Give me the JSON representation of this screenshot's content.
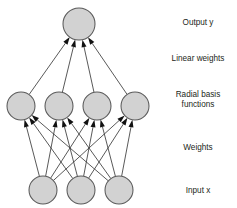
{
  "diagram": {
    "type": "neural-network-architecture",
    "background_color": "#ffffff",
    "node_fill_color": "#d2d2d2",
    "node_stroke_color": "#5a5a5a",
    "edge_color": "#3b3b3b",
    "arrow_color": "#111111",
    "text_color": "#231f20",
    "labels": [
      {
        "id": "output",
        "text": "Output y",
        "x": 198,
        "y": 25,
        "lines": [
          "Output y"
        ]
      },
      {
        "id": "linear-weights",
        "text": "Linear weights",
        "x": 198,
        "y": 61,
        "lines": [
          "Linear weights"
        ]
      },
      {
        "id": "radial-basis-functions",
        "text": "Radial basis functions",
        "x": 198,
        "y": 102,
        "lines": [
          "Radial basis",
          "functions"
        ]
      },
      {
        "id": "weights",
        "text": "Weights",
        "x": 198,
        "y": 150,
        "lines": [
          "Weights"
        ]
      },
      {
        "id": "input",
        "text": "Input x",
        "x": 198,
        "y": 193,
        "lines": [
          "Input x"
        ]
      }
    ],
    "layers": [
      {
        "id": "output-layer",
        "name": "output-layer",
        "role": "Output y",
        "node_count": 1,
        "radius": 16,
        "cy": 24,
        "nodes": [
          {
            "id": "output-node-1",
            "cx": 79,
            "cy": 24
          }
        ]
      },
      {
        "id": "hidden-layer",
        "name": "radial-basis-layer",
        "role": "Radial basis functions",
        "node_count": 4,
        "radius": 14,
        "cy": 106,
        "nodes": [
          {
            "id": "hidden-node-1",
            "cx": 21,
            "cy": 106
          },
          {
            "id": "hidden-node-2",
            "cx": 59,
            "cy": 106
          },
          {
            "id": "hidden-node-3",
            "cx": 97,
            "cy": 106
          },
          {
            "id": "hidden-node-4",
            "cx": 135,
            "cy": 106
          }
        ]
      },
      {
        "id": "input-layer",
        "name": "input-layer",
        "role": "Input x",
        "node_count": 3,
        "radius": 14,
        "cy": 190,
        "nodes": [
          {
            "id": "input-node-1",
            "cx": 43,
            "cy": 190
          },
          {
            "id": "input-node-2",
            "cx": 81,
            "cy": 190
          },
          {
            "id": "input-node-3",
            "cx": 119,
            "cy": 190
          }
        ]
      }
    ],
    "connections": {
      "hidden_to_output": {
        "label": "Linear weights",
        "count": 4,
        "directed": true,
        "edges": [
          {
            "from": "hidden-node-1",
            "to": "output-node-1"
          },
          {
            "from": "hidden-node-2",
            "to": "output-node-1"
          },
          {
            "from": "hidden-node-3",
            "to": "output-node-1"
          },
          {
            "from": "hidden-node-4",
            "to": "output-node-1"
          }
        ]
      },
      "input_to_hidden": {
        "label": "Weights",
        "count": 12,
        "directed": true,
        "edges": [
          {
            "from": "input-node-1",
            "to": "hidden-node-1"
          },
          {
            "from": "input-node-1",
            "to": "hidden-node-2"
          },
          {
            "from": "input-node-1",
            "to": "hidden-node-3"
          },
          {
            "from": "input-node-1",
            "to": "hidden-node-4"
          },
          {
            "from": "input-node-2",
            "to": "hidden-node-1"
          },
          {
            "from": "input-node-2",
            "to": "hidden-node-2"
          },
          {
            "from": "input-node-2",
            "to": "hidden-node-3"
          },
          {
            "from": "input-node-2",
            "to": "hidden-node-4"
          },
          {
            "from": "input-node-3",
            "to": "hidden-node-1"
          },
          {
            "from": "input-node-3",
            "to": "hidden-node-2"
          },
          {
            "from": "input-node-3",
            "to": "hidden-node-3"
          },
          {
            "from": "input-node-3",
            "to": "hidden-node-4"
          }
        ]
      }
    }
  }
}
